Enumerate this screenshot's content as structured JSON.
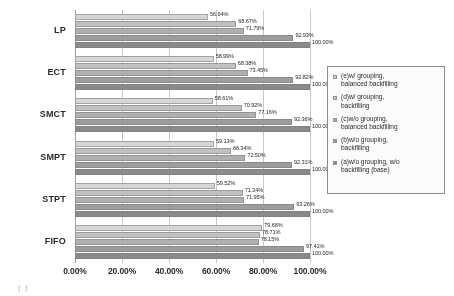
{
  "chart_data": {
    "type": "bar",
    "orientation": "horizontal",
    "title": "",
    "xlabel": "",
    "ylabel": "",
    "xlim": [
      0,
      100
    ],
    "grid": true,
    "legend_position": "right",
    "categories": [
      "LP",
      "ECT",
      "SMCT",
      "SMPT",
      "STPT",
      "FIFO"
    ],
    "xticks": [
      "0.00%",
      "20.00%",
      "40.00%",
      "60.00%",
      "80.00%",
      "100.00%"
    ],
    "xtick_values": [
      0,
      20,
      40,
      60,
      80,
      100
    ],
    "series": [
      {
        "name": "(e)w/ grouping, balanced backfilling",
        "color": "#d8d8d8",
        "values": [
          56.64,
          58.99,
          58.61,
          59.13,
          59.52,
          79.68
        ],
        "labels": [
          "56.64%",
          "58.99%",
          "58.61%",
          "59.13%",
          "59.52%",
          "79.68%"
        ]
      },
      {
        "name": "(d)w/ grouping, backfilling",
        "color": "#c2c2c2",
        "values": [
          68.67,
          68.38,
          70.92,
          66.34,
          71.34,
          78.71
        ],
        "labels": [
          "68.67%",
          "68.38%",
          "70.92%",
          "66.34%",
          "71.34%",
          "78.71%"
        ]
      },
      {
        "name": "(c)w/o grouping, balanced backfilling",
        "color": "#b0b0b0",
        "values": [
          71.79,
          73.45,
          77.16,
          72.5,
          71.95,
          78.15
        ],
        "labels": [
          "71.79%",
          "73.45%",
          "77.16%",
          "72.50%",
          "71.95%",
          "78.15%"
        ]
      },
      {
        "name": "(b)w/o grouping, backfilling",
        "color": "#9c9c9c",
        "values": [
          92.93,
          92.82,
          92.36,
          92.31,
          93.26,
          97.41
        ],
        "labels": [
          "92.93%",
          "92.82%",
          "92.36%",
          "92.31%",
          "93.26%",
          "97.41%"
        ]
      },
      {
        "name": "(a)w/o grouping, w/o backfilling (base)",
        "color": "#888888",
        "values": [
          100.0,
          100.0,
          100.0,
          100.0,
          100.0,
          100.0
        ],
        "labels": [
          "100.00%",
          "100.00%",
          "100.00%",
          "100.00%",
          "100.00%",
          "100.00%"
        ]
      }
    ],
    "legend_entries": [
      "(e)w/ grouping,\nbalanced backfilling",
      "(d)w/ grouping,\nbackfilling",
      "(c)w/o grouping,\nbalanced backfilling",
      "(b)w/o grouping,\nbackfilling",
      "(a)w/o grouping, w/o\nbackfilling (base)"
    ]
  },
  "caption_fragment": "( )"
}
